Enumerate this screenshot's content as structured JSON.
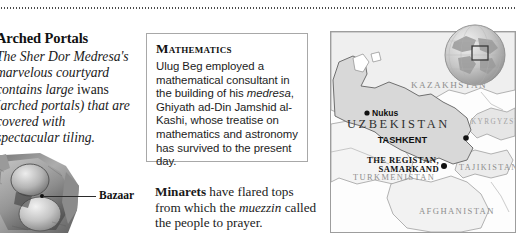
{
  "page": {
    "background_color": "#ffffff",
    "width": 516,
    "height": 233
  },
  "top_rule": {
    "style": "dotted",
    "color": "#4a4a4a"
  },
  "left_column": {
    "heading": "Arched Portals",
    "body_part1": "The Sher Dor Medresa's marvelous courtyard contains large ",
    "body_italic_term": "iwans",
    "body_part2": " (arched portals) that are covered with spectacular tiling."
  },
  "illustration": {
    "alt": "grayscale photographic illustration of a domed medresa model",
    "callout_label": "Bazaar"
  },
  "math_box": {
    "title": "Mathematics",
    "body_part1": "Ulug Beg employed a mathematical consultant in the building of his ",
    "body_italic_term": "medresa",
    "body_part2": ", Ghiyath ad-Din Jamshid al-Kashi, whose treatise on mathematics and astronomy has survived to the present day.",
    "border_color": "#a8a8a8"
  },
  "minarets": {
    "lead": "Minarets",
    "text_part1": " have flared tops from which the ",
    "italic_term": "muezzin",
    "text_part2": " called the people to prayer."
  },
  "map": {
    "countries": [
      {
        "name": "KAZAKHSTAN"
      },
      {
        "name": "UZBEKISTAN"
      },
      {
        "name": "KYRGYZSTAN"
      },
      {
        "name": "TAJIKISTAN"
      },
      {
        "name": "TURKMENISTAN"
      },
      {
        "name": "AFGHANISTAN"
      }
    ],
    "cities": [
      {
        "name": "Nukus"
      },
      {
        "name": "TASHKENT"
      }
    ],
    "sites": [
      {
        "line1": "THE REGISTAN,",
        "line2": "SAMARKAND"
      }
    ],
    "highlight_country": "UZBEKISTAN",
    "land_color": "#d8d8d8",
    "border_color": "#8e8e8e",
    "frame_color": "#9d9d9d",
    "globe_inset": {
      "label": "globe locator inset",
      "locator_box": true
    }
  }
}
